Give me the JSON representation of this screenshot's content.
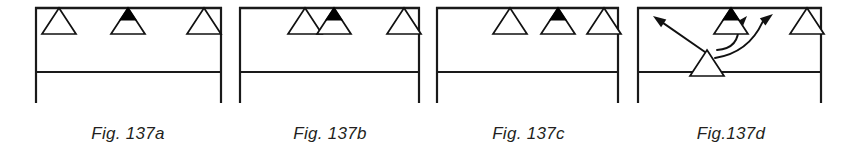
{
  "figure": {
    "background_color": "#ffffff",
    "line_color": "#1a1a1a",
    "marker_outline_color": "#111111",
    "marker_fill_color": "#ffffff",
    "marker_highlight_color": "#000000",
    "caption_color": "#231f20"
  },
  "panels": [
    {
      "id": "panel-a",
      "caption": "Fig. 137a",
      "x": 33,
      "width": 190,
      "rail": {
        "top_line_y": 8,
        "middle_line_y": 72,
        "left_post_x": 3,
        "right_post_x": 188,
        "post_bottom_y": 103
      },
      "markers": [
        {
          "name": "marker-1",
          "cx": 26,
          "filled": false,
          "below_rail": false
        },
        {
          "name": "marker-2",
          "cx": 95,
          "filled": true,
          "below_rail": false
        },
        {
          "name": "marker-3",
          "cx": 171,
          "filled": false,
          "below_rail": false
        }
      ],
      "arrows": []
    },
    {
      "id": "panel-b",
      "caption": "Fig. 137b",
      "x": 237,
      "width": 186,
      "rail": {
        "top_line_y": 8,
        "middle_line_y": 72,
        "left_post_x": 3,
        "right_post_x": 182,
        "post_bottom_y": 103
      },
      "markers": [
        {
          "name": "marker-1",
          "cx": 68,
          "filled": false,
          "below_rail": false
        },
        {
          "name": "marker-2",
          "cx": 97,
          "filled": true,
          "below_rail": false
        },
        {
          "name": "marker-3",
          "cx": 167,
          "filled": false,
          "below_rail": false
        }
      ],
      "arrows": []
    },
    {
      "id": "panel-c",
      "caption": "Fig. 137c",
      "x": 434,
      "width": 189,
      "rail": {
        "top_line_y": 8,
        "middle_line_y": 72,
        "left_post_x": 3,
        "right_post_x": 184,
        "post_bottom_y": 103
      },
      "markers": [
        {
          "name": "marker-1",
          "cx": 76,
          "filled": false,
          "below_rail": false
        },
        {
          "name": "marker-2",
          "cx": 124,
          "filled": true,
          "below_rail": false
        },
        {
          "name": "marker-3",
          "cx": 170,
          "filled": false,
          "below_rail": false
        }
      ],
      "arrows": []
    },
    {
      "id": "panel-d",
      "caption": "Fig.137d",
      "x": 635,
      "width": 192,
      "rail": {
        "top_line_y": 8,
        "middle_line_y": 72,
        "left_post_x": 3,
        "right_post_x": 186,
        "post_bottom_y": 103
      },
      "markers": [
        {
          "name": "marker-1",
          "cx": 72,
          "filled": false,
          "below_rail": true
        },
        {
          "name": "marker-2",
          "cx": 96,
          "filled": true,
          "below_rail": false
        },
        {
          "name": "marker-3",
          "cx": 172,
          "filled": false,
          "below_rail": false
        }
      ],
      "arrows": [
        {
          "name": "arrow-up-left",
          "from_x": 70,
          "from_y": 52,
          "to_x": 18,
          "to_y": 16,
          "curved": false
        },
        {
          "name": "arrow-up-center",
          "from_x": 82,
          "from_y": 50,
          "to_x": 112,
          "to_y": 16,
          "curved": true
        },
        {
          "name": "arrow-up-right",
          "from_x": 80,
          "from_y": 58,
          "to_x": 138,
          "to_y": 14,
          "curved": true
        }
      ]
    }
  ]
}
